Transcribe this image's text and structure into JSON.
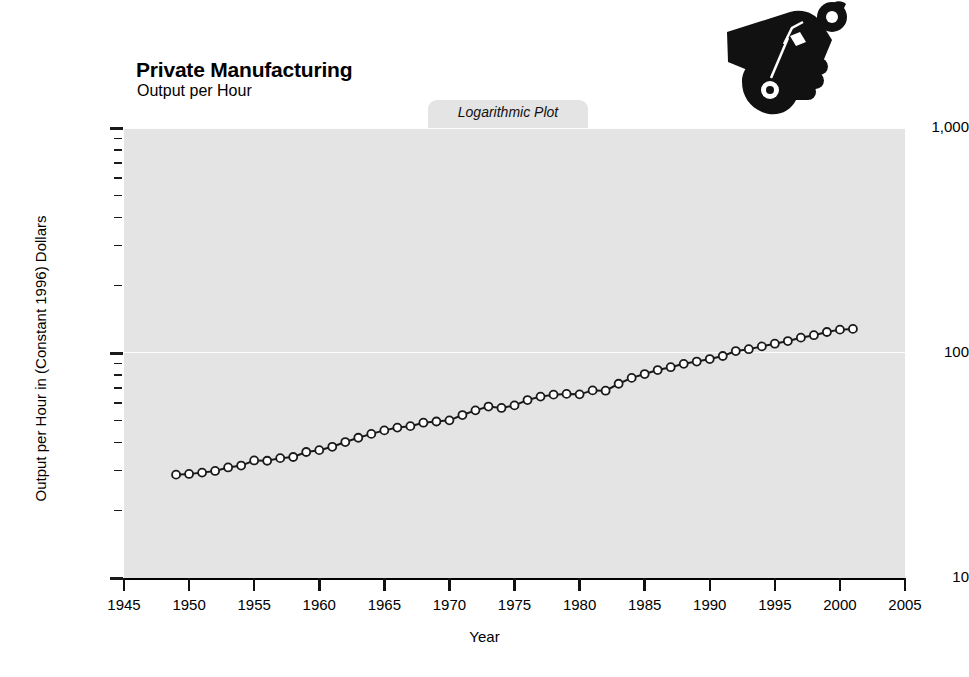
{
  "header": {
    "title": "Private Manufacturing",
    "subtitle": "Output per Hour",
    "badge": "Logarithmic Plot",
    "logo_icon": "hand-holding-wrench-icon"
  },
  "axes": {
    "x_title": "Year",
    "y_title": "Output per Hour in (Constant 1996) Dollars",
    "x_ticks": [
      "1945",
      "1950",
      "1955",
      "1960",
      "1965",
      "1970",
      "1975",
      "1980",
      "1985",
      "1990",
      "1995",
      "2000",
      "2005"
    ],
    "y_ticks": [
      "1,000",
      "100",
      "10"
    ]
  },
  "style": {
    "plot_background": "#e4e4e4",
    "gridline_color": "#fdfdfd",
    "line_color": "#1a1a1a",
    "marker_fill": "#ffffff",
    "text_color": "#000000"
  },
  "chart_data": {
    "type": "line",
    "subtitle": "Output per Hour",
    "annotation": "Logarithmic Plot",
    "xlabel": "Year",
    "ylabel": "Output per Hour in (Constant 1996) Dollars",
    "yscale": "log",
    "ylim": [
      10,
      1000
    ],
    "xlim": [
      1945,
      2005
    ],
    "grid": true,
    "legend": "none",
    "marker": "open-circle",
    "x": [
      1949,
      1950,
      1951,
      1952,
      1953,
      1954,
      1955,
      1956,
      1957,
      1958,
      1959,
      1960,
      1961,
      1962,
      1963,
      1964,
      1965,
      1966,
      1967,
      1968,
      1969,
      1970,
      1971,
      1972,
      1973,
      1974,
      1975,
      1976,
      1977,
      1978,
      1979,
      1980,
      1981,
      1982,
      1983,
      1984,
      1985,
      1986,
      1987,
      1988,
      1989,
      1990,
      1991,
      1992,
      1993,
      1994,
      1995,
      1996,
      1997,
      1998,
      1999,
      2000,
      2001
    ],
    "values": [
      28.8,
      29.0,
      29.4,
      29.9,
      31.0,
      31.6,
      33.3,
      33.2,
      34.1,
      34.5,
      36.3,
      37.0,
      38.3,
      40.2,
      42.0,
      43.7,
      45.3,
      46.6,
      47.3,
      49.0,
      49.6,
      50.2,
      53.0,
      55.6,
      57.8,
      57.0,
      58.5,
      61.8,
      64.0,
      65.3,
      65.8,
      65.5,
      68.2,
      68.0,
      73.0,
      77.5,
      80.6,
      84.0,
      86.5,
      89.5,
      91.6,
      94.0,
      97.0,
      102.0,
      104.0,
      107.0,
      110.0,
      113.0,
      117.0,
      120.0,
      124.0,
      127.0,
      128.0
    ]
  }
}
